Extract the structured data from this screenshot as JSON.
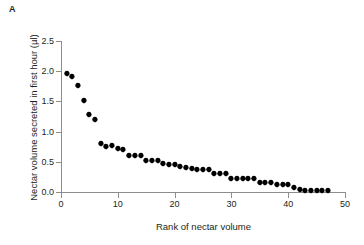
{
  "figure": {
    "panel_label": "A"
  },
  "chart_data": {
    "type": "scatter",
    "title": "",
    "xlabel": "Rank of nectar volume",
    "ylabel": "Nectar volume secreted in first hour (µl)",
    "xlim": [
      0,
      50
    ],
    "ylim": [
      0.0,
      2.5
    ],
    "xticks": [
      0,
      10,
      20,
      30,
      40,
      50
    ],
    "xtick_labels": [
      "0",
      "10",
      "20",
      "30",
      "40",
      "50"
    ],
    "yticks": [
      0.0,
      0.5,
      1.0,
      1.5,
      2.0,
      2.5
    ],
    "ytick_labels": [
      "0.0",
      "0.5",
      "1.0",
      "1.5",
      "2.0",
      "2.5"
    ],
    "grid": false,
    "legend": null,
    "marker": "diamond",
    "marker_color": "#000000",
    "x": [
      1,
      2,
      3,
      4,
      5,
      6,
      7,
      8,
      9,
      10,
      11,
      12,
      13,
      14,
      15,
      16,
      17,
      18,
      19,
      20,
      21,
      22,
      23,
      24,
      25,
      26,
      27,
      28,
      29,
      30,
      31,
      32,
      33,
      34,
      35,
      36,
      37,
      38,
      39,
      40,
      41,
      42,
      43,
      44,
      45,
      46,
      47
    ],
    "y": [
      1.95,
      1.9,
      1.75,
      1.5,
      1.27,
      1.2,
      0.8,
      0.75,
      0.76,
      0.71,
      0.7,
      0.6,
      0.6,
      0.6,
      0.51,
      0.51,
      0.51,
      0.47,
      0.44,
      0.44,
      0.41,
      0.4,
      0.38,
      0.37,
      0.37,
      0.37,
      0.3,
      0.29,
      0.29,
      0.22,
      0.21,
      0.21,
      0.21,
      0.21,
      0.15,
      0.15,
      0.15,
      0.11,
      0.11,
      0.11,
      0.06,
      0.03,
      0.01,
      0.01,
      0.01,
      0.01,
      0.01
    ],
    "series": [
      {
        "name": "Nectar volume",
        "values": [
          1.95,
          1.9,
          1.75,
          1.5,
          1.27,
          1.2,
          0.8,
          0.75,
          0.76,
          0.71,
          0.7,
          0.6,
          0.6,
          0.6,
          0.51,
          0.51,
          0.51,
          0.47,
          0.44,
          0.44,
          0.41,
          0.4,
          0.38,
          0.37,
          0.37,
          0.37,
          0.3,
          0.29,
          0.29,
          0.22,
          0.21,
          0.21,
          0.21,
          0.21,
          0.15,
          0.15,
          0.15,
          0.11,
          0.11,
          0.11,
          0.06,
          0.03,
          0.01,
          0.01,
          0.01,
          0.01,
          0.01
        ]
      }
    ]
  }
}
